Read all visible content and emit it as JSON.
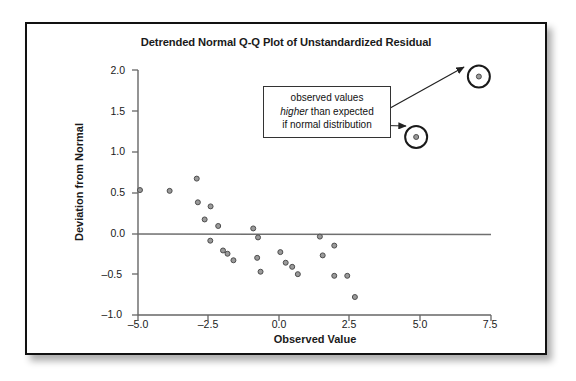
{
  "figure": {
    "title": "Detrended Normal Q-Q Plot of Unstandardized Residual",
    "annotation": {
      "line1": "observed values",
      "line2_italic": "higher",
      "line2_rest": " than expected",
      "line3": "if normal distribution"
    }
  },
  "chart_data": {
    "type": "scatter",
    "title": "Detrended Normal Q-Q Plot of Unstandardized Residual",
    "xlabel": "Observed Value",
    "ylabel": "Deviation from Normal",
    "xlim": [
      -5.0,
      7.5
    ],
    "ylim": [
      -1.0,
      2.0
    ],
    "xticks": [
      -5.0,
      -2.5,
      0.0,
      2.5,
      5.0,
      7.5
    ],
    "xticklabels": [
      "–5.0",
      "–2.5",
      "0.0",
      "2.5",
      "5.0",
      "7.5"
    ],
    "yticks": [
      -1.0,
      -0.5,
      0.0,
      0.5,
      1.0,
      1.5,
      2.0
    ],
    "yticklabels": [
      "–1.0",
      "–0.5",
      "0.0",
      "0.5",
      "1.0",
      "1.5",
      "2.0"
    ],
    "grid": false,
    "reference_line_y": 0.0,
    "legend": null,
    "marker": {
      "shape": "circle",
      "facecolor": "#9a9a9a",
      "edgecolor": "#4d4d4d",
      "size_px": 5
    },
    "points": [
      {
        "x": -4.93,
        "y": 0.53
      },
      {
        "x": -3.88,
        "y": 0.52
      },
      {
        "x": -2.92,
        "y": 0.67
      },
      {
        "x": -2.88,
        "y": 0.38
      },
      {
        "x": -2.43,
        "y": 0.33
      },
      {
        "x": -2.64,
        "y": 0.17
      },
      {
        "x": -2.44,
        "y": -0.09
      },
      {
        "x": -2.16,
        "y": 0.09
      },
      {
        "x": -1.99,
        "y": -0.21
      },
      {
        "x": -1.83,
        "y": -0.25
      },
      {
        "x": -1.62,
        "y": -0.33
      },
      {
        "x": -0.92,
        "y": 0.06
      },
      {
        "x": -0.75,
        "y": -0.05
      },
      {
        "x": -0.78,
        "y": -0.3
      },
      {
        "x": -0.66,
        "y": -0.47
      },
      {
        "x": 0.04,
        "y": -0.23
      },
      {
        "x": 0.23,
        "y": -0.36
      },
      {
        "x": 0.46,
        "y": -0.41
      },
      {
        "x": 0.66,
        "y": -0.5
      },
      {
        "x": 1.44,
        "y": -0.04
      },
      {
        "x": 1.54,
        "y": -0.27
      },
      {
        "x": 1.95,
        "y": -0.15
      },
      {
        "x": 1.95,
        "y": -0.52
      },
      {
        "x": 2.41,
        "y": -0.52
      },
      {
        "x": 2.68,
        "y": -0.78
      },
      {
        "x": 4.85,
        "y": 1.18,
        "highlighted": true
      },
      {
        "x": 7.07,
        "y": 1.92,
        "highlighted": true
      }
    ],
    "annotations": [
      {
        "text": "observed values higher than expected if normal distribution",
        "points_to": [
          [
            7.07,
            1.92
          ],
          [
            4.85,
            1.18
          ]
        ]
      }
    ]
  }
}
